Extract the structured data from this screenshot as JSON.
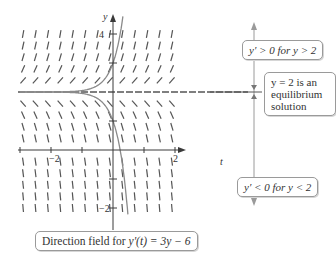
{
  "figure": {
    "equation": "y'(t) = 3y - 6",
    "caption": {
      "prefix": "Direction field for ",
      "expr": "y'(t) = 3y − 6"
    },
    "axes": {
      "x_label": "t",
      "y_label": "y",
      "x_ticks": [
        {
          "value": -2,
          "label": "−2"
        },
        {
          "value": 2,
          "label": "2"
        }
      ],
      "y_ticks": [
        {
          "value": 4,
          "label": "4"
        },
        {
          "value": -2,
          "label": "−2"
        }
      ],
      "x_range": [
        -3,
        2.3
      ],
      "y_range": [
        -2.3,
        4.6
      ]
    },
    "equilibrium": {
      "y": 2,
      "style": "dashed"
    },
    "field_grid": {
      "t_values": [
        -2.9,
        -2.5,
        -2.1,
        -1.7,
        -1.3,
        -0.9,
        -0.5,
        -0.1,
        0.3,
        0.7,
        1.1,
        1.5,
        1.9
      ],
      "y_values": [
        4,
        3.6,
        3.2,
        2.8,
        2.4,
        1.6,
        1.2,
        0.8,
        0.4,
        -0.4,
        -0.8,
        -1.2,
        -1.6,
        -2
      ]
    },
    "solution_curves": [
      {
        "name": "above-equilibrium",
        "y0_at_t0": 3
      },
      {
        "name": "below-equilibrium",
        "y0_at_t0": 1
      }
    ],
    "annotations": {
      "positive": {
        "lhs": "y′ > 0 for ",
        "rhs": "y > 2"
      },
      "equilibrium": {
        "line1": "y = 2 is an",
        "line2": "equilibrium",
        "line3": "solution"
      },
      "negative": {
        "lhs": "y′ < 0 for ",
        "rhs": "y < 2"
      }
    },
    "colors": {
      "axis": "#3a3a3a",
      "field_segment": "#555555",
      "curve": "#8a8a8a",
      "callout_border": "#9a9a9a",
      "side_arrow": "#9a9a9a"
    }
  }
}
